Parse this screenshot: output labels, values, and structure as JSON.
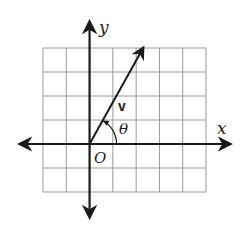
{
  "diagram": {
    "type": "coordinate-plane-vector",
    "grid": {
      "columns": 7,
      "rows": 6,
      "x_min": -2,
      "x_max": 5,
      "y_min": -2,
      "y_max": 4
    },
    "axes": {
      "x_label": "x",
      "y_label": "y",
      "origin_label": "O"
    },
    "vector": {
      "label": "v",
      "from": [
        0,
        0
      ],
      "to": [
        2.3,
        4
      ]
    },
    "angle": {
      "label": "θ",
      "between": "positive x-axis and vector v"
    },
    "colors": {
      "grid": "#9a9a9a",
      "axis": "#1a1a1a",
      "vector": "#1a1a1a",
      "background": "#ffffff"
    }
  }
}
